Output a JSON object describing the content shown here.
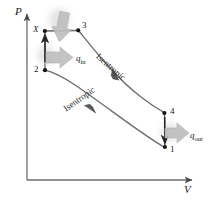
{
  "figure": {
    "type": "pv-diagram",
    "title": "",
    "axes": {
      "y_label": "P",
      "x_label": "V",
      "y_label_name": "pressure-axis-label",
      "x_label_name": "volume-axis-label"
    },
    "states": [
      {
        "id": "X",
        "label": "X",
        "x": 44,
        "y": 31
      },
      {
        "id": "3",
        "label": "3",
        "x": 78,
        "y": 30
      },
      {
        "id": "2",
        "label": "2",
        "x": 45,
        "y": 70
      },
      {
        "id": "4",
        "label": "4",
        "x": 164,
        "y": 113
      },
      {
        "id": "1",
        "label": "1",
        "x": 165,
        "y": 147
      }
    ],
    "processes": [
      {
        "from": "2",
        "to": "X",
        "label": "",
        "kind": "isochoric-heat-addition"
      },
      {
        "from": "X",
        "to": "3",
        "label": "",
        "kind": "isobaric-heat-addition"
      },
      {
        "from": "3",
        "to": "4",
        "label": "Isentropic",
        "kind": "isentropic-expansion"
      },
      {
        "from": "4",
        "to": "1",
        "label": "",
        "kind": "isochoric-heat-rejection"
      },
      {
        "from": "1",
        "to": "2",
        "label": "Isentropic",
        "kind": "isentropic-compression"
      }
    ],
    "heat_flows": [
      {
        "id": "q_in",
        "symbol": "q",
        "subscript": "in",
        "label": "q_in"
      },
      {
        "id": "q_out",
        "symbol": "q",
        "subscript": "out",
        "label": "q_out"
      }
    ],
    "colors": {
      "curve": "#6b6b6b",
      "axis": "#6b6b6b",
      "point": "#141414",
      "text": "#1a1a1a",
      "heat_arrow": "#b5b5b5",
      "glow": "#d9d9d9"
    }
  }
}
